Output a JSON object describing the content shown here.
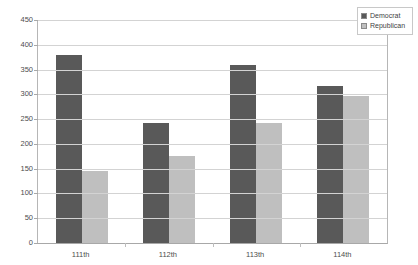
{
  "chart_data": {
    "type": "bar",
    "title": "",
    "subtitle": "",
    "xlabel": "",
    "ylabel": "",
    "categories": [
      "111th",
      "112th",
      "113th",
      "114th"
    ],
    "series": [
      {
        "name": "Democrat",
        "color": "#595959",
        "values": [
          380,
          243,
          360,
          317
        ]
      },
      {
        "name": "Republican",
        "color": "#bfbfbf",
        "values": [
          145,
          175,
          242,
          297
        ]
      }
    ],
    "ylim": [
      0,
      450
    ],
    "ytick_step": 50,
    "yticks": [
      0,
      50,
      100,
      150,
      200,
      250,
      300,
      350,
      400,
      450
    ],
    "ytick_labels": [
      "0",
      "50",
      "100",
      "150",
      "200",
      "250",
      "300",
      "350",
      "400",
      "450"
    ],
    "grid": true,
    "grid_axis": "y",
    "legend_position": "top-right",
    "bar_gap": "grouped-adjacent"
  },
  "legend": {
    "entries": [
      {
        "label": "Democrat",
        "swatch": "legend-swatch-democrat"
      },
      {
        "label": "Republican",
        "swatch": "legend-swatch-republican"
      }
    ]
  },
  "colors": {
    "democrat": "#595959",
    "republican": "#bfbfbf",
    "gridline": "#d3d3d3",
    "axis": "#a8a8a8",
    "tick_text": "#4d4d4d"
  }
}
